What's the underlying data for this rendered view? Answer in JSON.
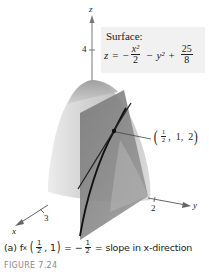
{
  "figure": {
    "number_label": "FIGURE 7.24",
    "caption": {
      "part": "(a)",
      "func": "f",
      "subscript": "x",
      "arg_num": "1",
      "arg_den": "2",
      "arg_rest": ", 1",
      "equals": "=",
      "minus": "−",
      "val_num": "1",
      "val_den": "2",
      "tail": "= slope in x-direction"
    },
    "surface_label": {
      "title": "Surface:",
      "lhs": "z",
      "equals": "=",
      "minus1": "−",
      "term1_num": "x²",
      "term1_den": "2",
      "minus2": "−",
      "term2": "y²",
      "plus": "+",
      "term3_num": "25",
      "term3_den": "8"
    },
    "point_label": {
      "x_num": "1",
      "x_den": "2",
      "rest": ",  1,  2"
    },
    "axes": {
      "z": {
        "label": "z",
        "tick": "4"
      },
      "x": {
        "label": "x",
        "tick": "3"
      },
      "y": {
        "label": "y",
        "tick": "2"
      }
    },
    "colors": {
      "surface_light": "#e2e2e2",
      "surface_mid": "#c4c4c4",
      "plane": "#8c8c8c",
      "plane_dark": "#6e6e6e",
      "curve": "#111111",
      "axis": "#555555",
      "label_box": "#f1f1f1",
      "figure_number": "#8a8a8a"
    }
  }
}
